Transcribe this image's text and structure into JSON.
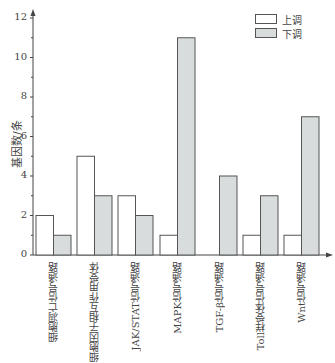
{
  "chart_data": {
    "type": "bar",
    "title": "",
    "xlabel": "",
    "ylabel": "基因数/条",
    "ylim": [
      0,
      12
    ],
    "yticks": [
      0,
      2,
      4,
      6,
      8,
      10,
      12
    ],
    "grid": false,
    "legend_position": "top-right",
    "categories": [
      "细胞凋亡信号通路",
      "细胞因子相互作用受体",
      "JAK/STAT信号通路",
      "MAPK信号通路",
      "TGF-β信号通路",
      "Toll样受体信号通路",
      "Wnt信号通路"
    ],
    "series": [
      {
        "name": "上调",
        "color": "#ffffff",
        "values": [
          2,
          5,
          3,
          1,
          0,
          1,
          1
        ]
      },
      {
        "name": "下调",
        "color": "#d9dcdd",
        "values": [
          1,
          3,
          2,
          11,
          4,
          3,
          7
        ]
      }
    ]
  },
  "legend": {
    "up_label": "上调",
    "down_label": "下调"
  },
  "axis": {
    "ylabel": "基因数/条"
  }
}
